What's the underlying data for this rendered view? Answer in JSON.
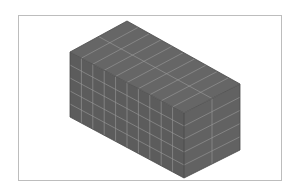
{
  "diagram": {
    "type": "isometric-mesh-box",
    "colors": {
      "background": "#ffffff",
      "frame": "#bdbdbd",
      "top_face": "#666666",
      "left_face": "#5c5c5c",
      "right_face": "#626262",
      "grid_line": "#9a9a9a",
      "edge": "#4a4a4a"
    },
    "vertices": {
      "back_top": [
        127,
        21
      ],
      "left_top": [
        70,
        52
      ],
      "front_top": [
        184,
        113
      ],
      "right_top": [
        240,
        84
      ],
      "left_bottom": [
        70,
        117
      ],
      "front_bottom": [
        184,
        178
      ],
      "right_bottom": [
        240,
        150
      ]
    },
    "mesh": {
      "long_divisions": 10,
      "short_divisions": 2,
      "height_divisions": 5
    }
  }
}
